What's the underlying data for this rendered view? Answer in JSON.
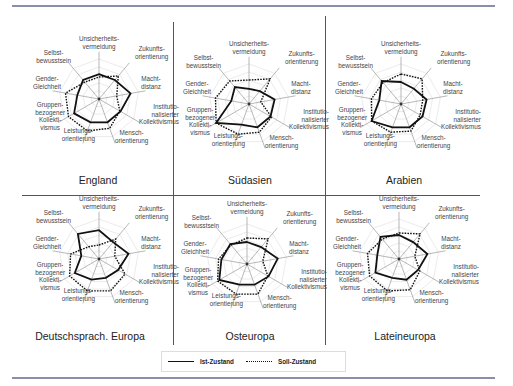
{
  "axes": [
    "Unsicherheits-\nvermeidung",
    "Zukunfts-\norientierung",
    "Macht-\ndistanz",
    "Institutio-\nnalisierter\nKollektivismus",
    "Mensch-\norientierung",
    "Leistungs-\norientierung",
    "Gruppen-\nbezogener\nKollekti-\nvismus",
    "Gender-\nGleichheit",
    "Selbst-\nbewusstsein"
  ],
  "legend": {
    "ist": "Ist-Zustand",
    "soll": "Soll-Zustand"
  },
  "panels": {
    "england": {
      "title": "England"
    },
    "suedasien": {
      "title": "Südasien"
    },
    "arabien": {
      "title": "Arabien"
    },
    "deutsch": {
      "title": "Deutschsprach. Europa"
    },
    "osteuropa": {
      "title": "Osteuropa"
    },
    "latein": {
      "title": "Lateineuropa"
    }
  },
  "chart_data": [
    {
      "type": "radar",
      "title": "England",
      "categories": [
        "Unsicherheitsvermeidung",
        "Zukunftsorientierung",
        "Machtdistanz",
        "Institutionalisierter Kollektivismus",
        "Menschorientierung",
        "Leistungsorientierung",
        "Gruppenbezogener Kollektivismus",
        "Gender-Gleichheit",
        "Selbstbewusstsein"
      ],
      "series": [
        {
          "name": "Ist-Zustand",
          "style": "solid",
          "values": [
            0.62,
            0.62,
            0.8,
            0.62,
            0.62,
            0.62,
            0.72,
            0.55,
            0.62
          ]
        },
        {
          "name": "Soll-Zustand",
          "style": "dotted",
          "values": [
            0.55,
            0.75,
            0.45,
            0.6,
            0.78,
            0.85,
            0.88,
            0.85,
            0.55
          ]
        }
      ],
      "grid": true
    },
    {
      "type": "radar",
      "title": "Südasien",
      "categories": [
        "Unsicherheitsvermeidung",
        "Zukunftsorientierung",
        "Machtdistanz",
        "Institutionalisierter Kollektivismus",
        "Menschorientierung",
        "Leistungsorientierung",
        "Gruppenbezogener Kollektivismus",
        "Gender-Gleichheit",
        "Selbstbewusstsein"
      ],
      "series": [
        {
          "name": "Ist-Zustand",
          "style": "solid",
          "values": [
            0.38,
            0.42,
            0.65,
            0.62,
            0.62,
            0.55,
            0.95,
            0.45,
            0.55
          ]
        },
        {
          "name": "Soll-Zustand",
          "style": "dotted",
          "values": [
            0.6,
            0.82,
            0.3,
            0.65,
            0.75,
            0.8,
            0.95,
            0.85,
            0.75
          ]
        }
      ],
      "grid": true
    },
    {
      "type": "radar",
      "title": "Arabien",
      "categories": [
        "Unsicherheitsvermeidung",
        "Zukunftsorientierung",
        "Machtdistanz",
        "Institutionalisierter Kollektivismus",
        "Menschorientierung",
        "Leistungsorientierung",
        "Gruppenbezogener Kollektivismus",
        "Gender-Gleichheit",
        "Selbstbewusstsein"
      ],
      "series": [
        {
          "name": "Ist-Zustand",
          "style": "solid",
          "values": [
            0.55,
            0.5,
            0.65,
            0.62,
            0.62,
            0.62,
            0.85,
            0.55,
            0.75
          ]
        },
        {
          "name": "Soll-Zustand",
          "style": "dotted",
          "values": [
            0.75,
            0.82,
            0.55,
            0.55,
            0.72,
            0.75,
            0.85,
            0.75,
            0.7
          ]
        }
      ],
      "grid": true
    },
    {
      "type": "radar",
      "title": "Deutschsprach. Europa",
      "categories": [
        "Unsicherheitsvermeidung",
        "Zukunftsorientierung",
        "Machtdistanz",
        "Institutionalisierter Kollektivismus",
        "Menschorientierung",
        "Leistungsorientierung",
        "Gruppenbezogener Kollektivismus",
        "Gender-Gleichheit",
        "Selbstbewusstsein"
      ],
      "series": [
        {
          "name": "Ist-Zustand",
          "style": "solid",
          "values": [
            0.72,
            0.55,
            0.75,
            0.55,
            0.5,
            0.55,
            0.7,
            0.45,
            0.82
          ]
        },
        {
          "name": "Soll-Zustand",
          "style": "dotted",
          "values": [
            0.35,
            0.65,
            0.4,
            0.75,
            0.85,
            0.85,
            0.85,
            0.72,
            0.4
          ]
        }
      ],
      "grid": true
    },
    {
      "type": "radar",
      "title": "Osteuropa",
      "categories": [
        "Unsicherheitsvermeidung",
        "Zukunftsorientierung",
        "Machtdistanz",
        "Institutionalisierter Kollektivismus",
        "Menschorientierung",
        "Leistungsorientierung",
        "Gruppenbezogener Kollektivismus",
        "Gender-Gleichheit",
        "Selbstbewusstsein"
      ],
      "series": [
        {
          "name": "Ist-Zustand",
          "style": "solid",
          "values": [
            0.55,
            0.55,
            0.78,
            0.62,
            0.55,
            0.55,
            0.8,
            0.65,
            0.65
          ]
        },
        {
          "name": "Soll-Zustand",
          "style": "dotted",
          "values": [
            0.65,
            0.82,
            0.4,
            0.6,
            0.8,
            0.8,
            0.85,
            0.72,
            0.62
          ]
        }
      ],
      "grid": true
    },
    {
      "type": "radar",
      "title": "Lateineuropa",
      "categories": [
        "Unsicherheitsvermeidung",
        "Zukunftsorientierung",
        "Machtdistanz",
        "Institutionalisierter Kollektivismus",
        "Menschorientierung",
        "Leistungsorientierung",
        "Gruppenbezogener Kollektivismus",
        "Gender-Gleichheit",
        "Selbstbewusstsein"
      ],
      "series": [
        {
          "name": "Ist-Zustand",
          "style": "solid",
          "values": [
            0.6,
            0.55,
            0.72,
            0.55,
            0.55,
            0.5,
            0.68,
            0.55,
            0.72
          ]
        },
        {
          "name": "Soll-Zustand",
          "style": "dotted",
          "values": [
            0.65,
            0.82,
            0.4,
            0.6,
            0.82,
            0.85,
            0.85,
            0.8,
            0.65
          ]
        }
      ],
      "grid": true
    }
  ]
}
